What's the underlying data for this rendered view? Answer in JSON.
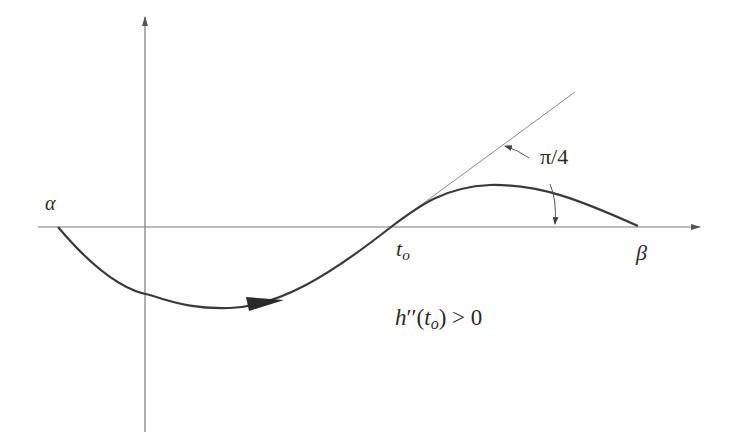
{
  "diagram": {
    "type": "function-sketch",
    "colors": {
      "axis": "#6e6e6e",
      "curve": "#3c3c3c",
      "tangent": "#8a8a8a",
      "text": "#2a2a2a",
      "background": "#ffffff"
    },
    "labels": {
      "alpha": "α",
      "beta": "β",
      "t_main": "t",
      "t_sub": "o",
      "angle": "π/4",
      "condition_h": "h",
      "condition_primes": "′′",
      "condition_open": "(",
      "condition_t": "t",
      "condition_sub": "o",
      "condition_close": ")",
      "condition_rest": " > 0"
    },
    "axes": {
      "x_axis": "horizontal axis with arrow",
      "y_axis": "vertical axis with arrow"
    },
    "curve": {
      "start": "alpha",
      "end": "beta",
      "crosses_axis_at": "t_o",
      "direction_arrow": "rightward on lower lobe"
    },
    "tangent": {
      "at": "t_o",
      "angle": "π/4"
    }
  }
}
